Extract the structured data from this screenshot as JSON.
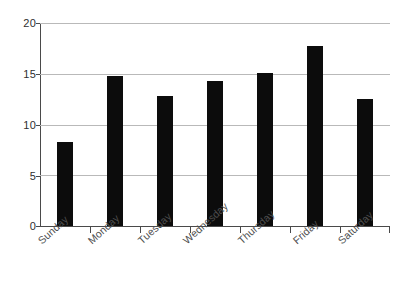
{
  "chart_data": {
    "type": "bar",
    "title": "",
    "xlabel": "",
    "ylabel": "",
    "categories": [
      "Sunday",
      "Monday",
      "Tuesday",
      "Wednesday",
      "Thursday",
      "Friday",
      "Saturday"
    ],
    "values": [
      8.3,
      14.8,
      12.8,
      14.3,
      15.1,
      17.7,
      12.5
    ],
    "ylim": [
      0,
      20
    ],
    "yticks": [
      0,
      5,
      10,
      15,
      20
    ],
    "ytick_labels": [
      "0",
      "5",
      "10",
      "15",
      "20"
    ],
    "grid": "horizontal",
    "legend": "none",
    "bar_color": "#0c0c0c",
    "gridline_color": "#b9b9b9",
    "axis_color": "#4a4a4a",
    "background_color": "#ffffff",
    "xtick_label_rotation": -42
  }
}
